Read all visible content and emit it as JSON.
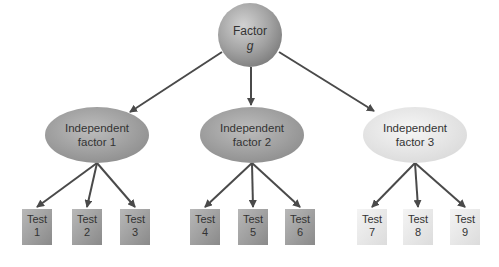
{
  "root": {
    "line1": "Factor",
    "line2": "g"
  },
  "factors": [
    {
      "line1": "Independent",
      "line2": "factor 1",
      "shade": "dark"
    },
    {
      "line1": "Independent",
      "line2": "factor 2",
      "shade": "dark"
    },
    {
      "line1": "Independent",
      "line2": "factor 3",
      "shade": "light"
    }
  ],
  "tests": [
    {
      "line1": "Test",
      "line2": "1",
      "factor": 0
    },
    {
      "line1": "Test",
      "line2": "2",
      "factor": 0
    },
    {
      "line1": "Test",
      "line2": "3",
      "factor": 0
    },
    {
      "line1": "Test",
      "line2": "4",
      "factor": 1
    },
    {
      "line1": "Test",
      "line2": "5",
      "factor": 1
    },
    {
      "line1": "Test",
      "line2": "6",
      "factor": 1
    },
    {
      "line1": "Test",
      "line2": "7",
      "factor": 2
    },
    {
      "line1": "Test",
      "line2": "8",
      "factor": 2
    },
    {
      "line1": "Test",
      "line2": "9",
      "factor": 2
    }
  ],
  "colors": {
    "arrow": "#4a4a4a",
    "dark_fill": "#9a9a9a",
    "light_fill": "#e4e4e4",
    "text": "#333333"
  }
}
